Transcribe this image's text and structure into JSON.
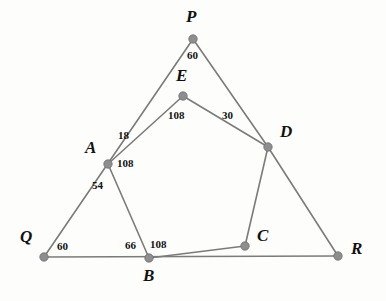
{
  "figure": {
    "kind": "geometry-diagram",
    "background_color": "#fdfdfc",
    "line_color": "#7b7b7b",
    "vertex_color": "#8e8e8e",
    "text_color": "#111111"
  },
  "vertices": {
    "P": {
      "label": "P",
      "x": 193,
      "y": 39,
      "label_x": 186,
      "label_y": 8
    },
    "E": {
      "label": "E",
      "x": 183,
      "y": 96,
      "label_x": 176,
      "label_y": 67
    },
    "A": {
      "label": "A",
      "x": 108,
      "y": 164,
      "label_x": 85,
      "label_y": 139
    },
    "D": {
      "label": "D",
      "x": 268,
      "y": 147,
      "label_x": 280,
      "label_y": 123
    },
    "Q": {
      "label": "Q",
      "x": 44,
      "y": 257,
      "label_x": 20,
      "label_y": 228
    },
    "B": {
      "label": "B",
      "x": 149,
      "y": 258,
      "label_x": 143,
      "label_y": 267
    },
    "C": {
      "label": "C",
      "x": 245,
      "y": 246,
      "label_x": 257,
      "label_y": 227
    },
    "R": {
      "label": "R",
      "x": 338,
      "y": 256,
      "label_x": 351,
      "label_y": 240
    }
  },
  "edges": [
    {
      "name": "edge-Q-P",
      "from": "Q",
      "to": "P"
    },
    {
      "name": "edge-P-D",
      "from": "P",
      "to": "D"
    },
    {
      "name": "edge-D-R",
      "from": "D",
      "to": "R"
    },
    {
      "name": "edge-Q-R",
      "from": "Q",
      "to": "R"
    },
    {
      "name": "edge-A-E",
      "from": "A",
      "to": "E"
    },
    {
      "name": "edge-E-D",
      "from": "E",
      "to": "D"
    },
    {
      "name": "edge-D-C",
      "from": "D",
      "to": "C"
    },
    {
      "name": "edge-C-B",
      "from": "C",
      "to": "B"
    },
    {
      "name": "edge-B-A",
      "from": "B",
      "to": "A"
    }
  ],
  "angle_labels": [
    {
      "name": "angle-at-P",
      "value": "60",
      "x": 187,
      "y": 50
    },
    {
      "name": "angle-at-E-left",
      "value": "108",
      "x": 168,
      "y": 110
    },
    {
      "name": "angle-at-E-right",
      "value": "30",
      "x": 222,
      "y": 110
    },
    {
      "name": "angle-at-A-upper",
      "value": "18",
      "x": 118,
      "y": 130
    },
    {
      "name": "angle-at-A-right",
      "value": "108",
      "x": 117,
      "y": 158
    },
    {
      "name": "angle-at-A-lower",
      "value": "54",
      "x": 92,
      "y": 180
    },
    {
      "name": "angle-at-Q",
      "value": "60",
      "x": 57,
      "y": 241
    },
    {
      "name": "angle-at-B-left",
      "value": "66",
      "x": 125,
      "y": 240
    },
    {
      "name": "angle-at-B-right",
      "value": "108",
      "x": 150,
      "y": 239
    }
  ]
}
